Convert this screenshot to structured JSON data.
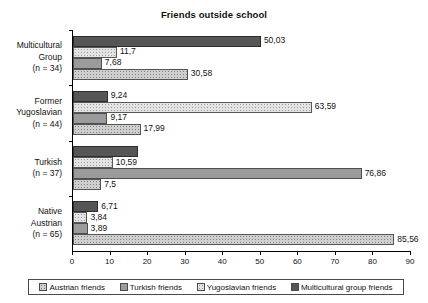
{
  "chart_data": {
    "type": "bar",
    "orientation": "horizontal",
    "title": "Friends outside school",
    "xlabel": "",
    "ylabel": "",
    "xlim": [
      0,
      90
    ],
    "xticks": [
      0,
      10,
      20,
      30,
      40,
      50,
      60,
      70,
      80,
      90
    ],
    "grid": false,
    "legend_position": "bottom",
    "categories": [
      "Multicultural Group (n = 34)",
      "Former Yugoslavian (n = 44)",
      "Turkish (n = 37)",
      "Native Austrian (n = 65)"
    ],
    "category_lines": [
      [
        "Multicultural",
        "Group",
        "(n = 34)"
      ],
      [
        "Former",
        "Yugoslavian",
        "(n = 44)"
      ],
      [
        "Turkish",
        "(n = 37)"
      ],
      [
        "Native",
        "Austrian",
        "(n = 65)"
      ]
    ],
    "series": [
      {
        "name": "Multicultural group friends",
        "pattern": "solid-dark",
        "color": "#565656",
        "values": [
          50.03,
          9.24,
          17.3,
          6.71
        ],
        "labels": [
          "50,03",
          "9,24",
          "",
          "6,71"
        ]
      },
      {
        "name": "Yugoslavian friends",
        "pattern": "fine-dots-light",
        "color": "#e3e3e3",
        "values": [
          11.7,
          63.59,
          10.59,
          3.84
        ],
        "labels": [
          "11,7",
          "63,59",
          "10,59",
          "3,84"
        ]
      },
      {
        "name": "Turkish friends",
        "pattern": "solid-gray",
        "color": "#9b9b9b",
        "values": [
          7.68,
          9.17,
          76.86,
          3.89
        ],
        "labels": [
          "7,68",
          "9,17",
          "76,86",
          "3,89"
        ]
      },
      {
        "name": "Austrian friends",
        "pattern": "coarse-dots",
        "color": "#cfcfcf",
        "values": [
          30.58,
          17.99,
          7.5,
          85.56
        ],
        "labels": [
          "30,58",
          "17,99",
          "7,5",
          "85,56"
        ]
      }
    ]
  },
  "legend": {
    "items": [
      {
        "label": "Austrian friends",
        "series_key": "austrian"
      },
      {
        "label": "Turkish friends",
        "series_key": "turkish"
      },
      {
        "label": "Yugoslavian friends",
        "series_key": "yugoslavian"
      },
      {
        "label": "Multicultural group friends",
        "series_key": "multicultural"
      }
    ]
  }
}
